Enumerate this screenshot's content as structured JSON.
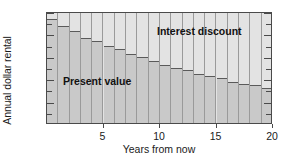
{
  "chart_data": {
    "type": "bar",
    "title": "",
    "xlabel": "Years from now",
    "ylabel": "Annual dollar rental",
    "xlim": [
      0,
      20
    ],
    "ylim": [
      0,
      100
    ],
    "grid": false,
    "stacked": true,
    "legend_position": "in-plot annotations",
    "x": [
      1,
      2,
      3,
      4,
      5,
      6,
      7,
      8,
      9,
      10,
      11,
      12,
      13,
      14,
      15,
      16,
      17,
      18,
      19,
      20
    ],
    "xticks": [
      5,
      10,
      15,
      20
    ],
    "xtick_labels": [
      "5",
      "10",
      "15",
      "20"
    ],
    "yticks": [
      0,
      20,
      40,
      60,
      80,
      100
    ],
    "ytick_labels": [
      "0",
      "20",
      "40",
      "60",
      "80",
      "100"
    ],
    "ytick_minor": [
      10,
      30,
      50,
      70,
      90
    ],
    "series": [
      {
        "name": "Present value",
        "color": "#c9c9c9",
        "values": [
          93,
          87,
          82,
          76,
          73,
          69,
          66,
          62,
          59,
          55,
          52,
          49,
          47,
          44,
          42,
          40,
          37,
          35,
          34,
          31
        ]
      },
      {
        "name": "Interest discount",
        "color": "#e3e3e3",
        "values": [
          7,
          13,
          18,
          24,
          27,
          31,
          34,
          38,
          41,
          45,
          48,
          51,
          53,
          56,
          58,
          60,
          63,
          65,
          66,
          69
        ]
      }
    ],
    "total_per_bar": 100,
    "annotations": [
      {
        "text": "Present value",
        "x": 3.2,
        "y": 45
      },
      {
        "text": "Interest discount",
        "x": 11.4,
        "y": 92
      }
    ]
  }
}
